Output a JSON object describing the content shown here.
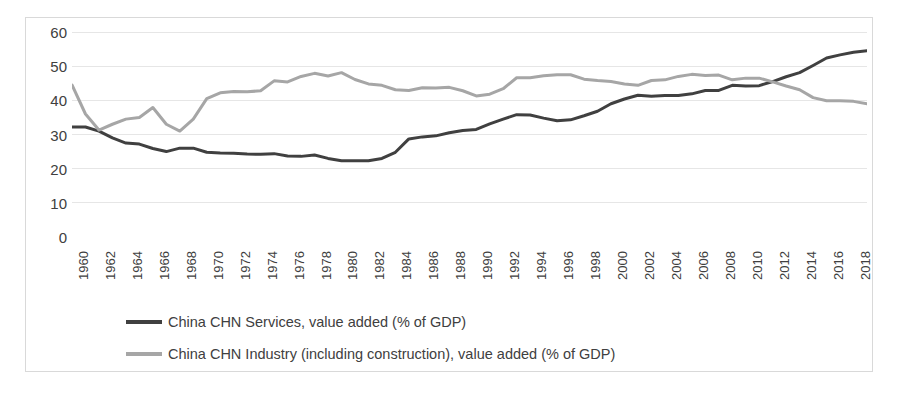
{
  "chart_data": {
    "type": "line",
    "title": "",
    "xlabel": "",
    "ylabel": "",
    "ylim": [
      0,
      60
    ],
    "y_ticks": [
      0,
      10,
      20,
      30,
      40,
      50,
      60
    ],
    "grid": true,
    "legend_position": "bottom-left",
    "x_tick_labels": [
      "1960",
      "1962",
      "1964",
      "1966",
      "1968",
      "1970",
      "1972",
      "1974",
      "1976",
      "1978",
      "1980",
      "1982",
      "1984",
      "1986",
      "1988",
      "1990",
      "1992",
      "1994",
      "1996",
      "1998",
      "2000",
      "2002",
      "2004",
      "2006",
      "2008",
      "2010",
      "2012",
      "2014",
      "2016",
      "2018"
    ],
    "x": [
      1960,
      1961,
      1962,
      1963,
      1964,
      1965,
      1966,
      1967,
      1968,
      1969,
      1970,
      1971,
      1972,
      1973,
      1974,
      1975,
      1976,
      1977,
      1978,
      1979,
      1980,
      1981,
      1982,
      1983,
      1984,
      1985,
      1986,
      1987,
      1988,
      1989,
      1990,
      1991,
      1992,
      1993,
      1994,
      1995,
      1996,
      1997,
      1998,
      1999,
      2000,
      2001,
      2002,
      2003,
      2004,
      2005,
      2006,
      2007,
      2008,
      2009,
      2010,
      2011,
      2012,
      2013,
      2014,
      2015,
      2016,
      2017,
      2018,
      2019
    ],
    "series": [
      {
        "name": "China CHN Services, value added (% of GDP)",
        "color": "#404040",
        "values": [
          32.2,
          32.2,
          31.0,
          29.0,
          27.5,
          27.2,
          25.9,
          25.0,
          26.0,
          26.0,
          24.8,
          24.6,
          24.5,
          24.3,
          24.2,
          24.4,
          23.7,
          23.6,
          24.0,
          23.0,
          22.3,
          22.3,
          22.3,
          23.0,
          24.8,
          28.7,
          29.3,
          29.6,
          30.5,
          31.2,
          31.5,
          33.1,
          34.5,
          35.8,
          35.7,
          34.8,
          34.0,
          34.3,
          35.5,
          36.8,
          39.0,
          40.4,
          41.5,
          41.2,
          41.4,
          41.4,
          41.9,
          42.9,
          42.9,
          44.4,
          44.2,
          44.3,
          45.5,
          46.9,
          48.1,
          50.2,
          52.4,
          53.3,
          54.1,
          54.5
        ]
      },
      {
        "name": "China CHN Industry (including construction), value added (% of GDP)",
        "color": "#a6a6a6",
        "values": [
          44.5,
          36.0,
          31.3,
          33.0,
          34.5,
          35.0,
          37.9,
          33.0,
          31.0,
          34.5,
          40.5,
          42.2,
          42.6,
          42.5,
          42.8,
          45.7,
          45.4,
          47.0,
          47.9,
          47.1,
          48.1,
          46.1,
          44.8,
          44.4,
          43.1,
          42.9,
          43.7,
          43.6,
          43.8,
          42.8,
          41.3,
          41.8,
          43.4,
          46.6,
          46.6,
          47.2,
          47.5,
          47.5,
          46.2,
          45.8,
          45.5,
          44.8,
          44.4,
          45.8,
          46.0,
          47.0,
          47.6,
          47.3,
          47.4,
          46.0,
          46.5,
          46.5,
          45.4,
          44.2,
          43.1,
          40.8,
          39.9,
          39.9,
          39.7,
          39.0
        ]
      }
    ]
  },
  "legend": {
    "items": [
      {
        "label": "China CHN Services, value added (% of GDP)",
        "color": "#404040"
      },
      {
        "label": "China CHN Industry (including construction), value added (% of GDP)",
        "color": "#a6a6a6"
      }
    ]
  },
  "colors": {
    "services": "#404040",
    "industry": "#a6a6a6",
    "grid": "#e6e6e6",
    "border": "#d9d9d9",
    "text": "#404040"
  }
}
